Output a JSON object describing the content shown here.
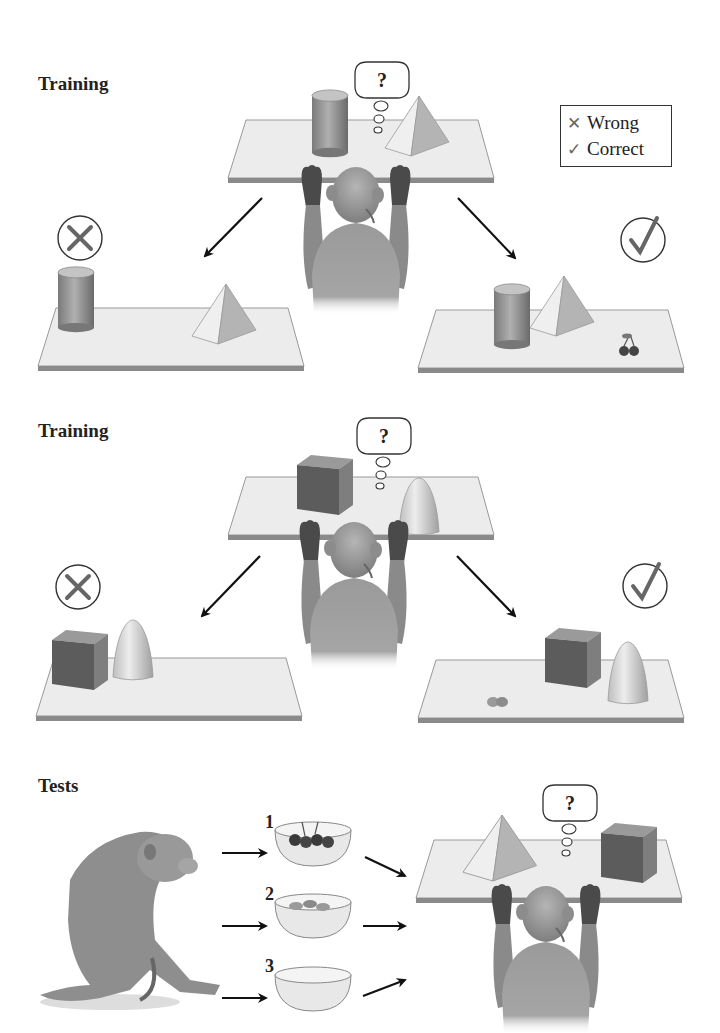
{
  "sections": [
    {
      "title": "Training",
      "cue_object": "cylinder",
      "other_object": "pyramid",
      "reward": "cherries"
    },
    {
      "title": "Training",
      "cue_object": "cube",
      "other_object": "cone",
      "reward": "peanuts"
    },
    {
      "title": "Tests",
      "objects": [
        "pyramid",
        "cube"
      ]
    }
  ],
  "legend": {
    "wrong_label": "Wrong",
    "correct_label": "Correct",
    "wrong_icon": "cross-icon",
    "correct_icon": "check-icon"
  },
  "thought_bubble": {
    "text": "?"
  },
  "test_bowls": [
    {
      "number": "1",
      "contents": "cherries"
    },
    {
      "number": "2",
      "contents": "peanuts"
    },
    {
      "number": "3",
      "contents": "empty"
    }
  ],
  "colors": {
    "table_top": "#ececec",
    "table_edge": "#8a8a8a",
    "object_dark": "#6e6e6e",
    "object_mid": "#a8a8a8",
    "object_light": "#e2e2e2",
    "monkey": "#9a9a9a",
    "monkey_dark": "#555555",
    "arrow": "#111111"
  }
}
